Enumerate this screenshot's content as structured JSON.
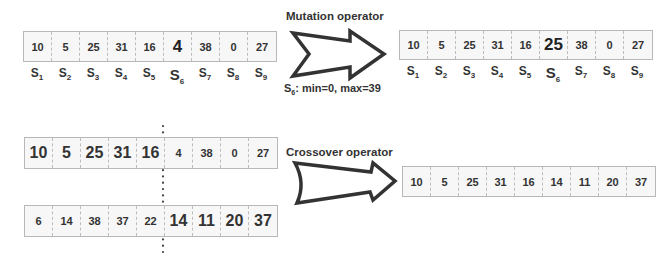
{
  "mutation": {
    "title": "Mutation operator",
    "constraint_prefix": "S",
    "constraint_sub": "6",
    "constraint_text": ": min=0, max=39",
    "before": [
      "10",
      "5",
      "25",
      "31",
      "16",
      "4",
      "38",
      "0",
      "27"
    ],
    "after": [
      "10",
      "5",
      "25",
      "31",
      "16",
      "25",
      "38",
      "0",
      "27"
    ],
    "highlight_index": 5,
    "labels": [
      {
        "base": "S",
        "sub": "1"
      },
      {
        "base": "S",
        "sub": "2"
      },
      {
        "base": "S",
        "sub": "3"
      },
      {
        "base": "S",
        "sub": "4"
      },
      {
        "base": "S",
        "sub": "5"
      },
      {
        "base": "S",
        "sub": "6"
      },
      {
        "base": "S",
        "sub": "7"
      },
      {
        "base": "S",
        "sub": "8"
      },
      {
        "base": "S",
        "sub": "9"
      }
    ]
  },
  "crossover": {
    "title": "Crossover operator",
    "parent1": [
      "10",
      "5",
      "25",
      "31",
      "16",
      "4",
      "38",
      "0",
      "27"
    ],
    "parent2": [
      "6",
      "14",
      "38",
      "37",
      "22",
      "14",
      "11",
      "20",
      "37"
    ],
    "crossover_point": 5,
    "child": [
      "10",
      "5",
      "25",
      "31",
      "16",
      "14",
      "11",
      "20",
      "37"
    ]
  }
}
